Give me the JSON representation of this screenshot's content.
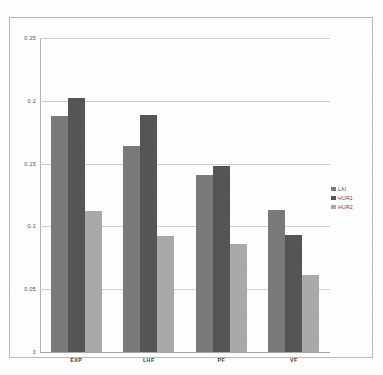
{
  "chart_data": {
    "type": "bar",
    "title": "",
    "xlabel": "",
    "ylabel": "",
    "categories": [
      "EXP",
      "LHF",
      "PF",
      "VF"
    ],
    "series": [
      {
        "name": "LAI",
        "color": "#7a7a7a",
        "values": [
          0.188,
          0.164,
          0.141,
          0.113
        ]
      },
      {
        "name": "HUR1",
        "color": "#555555",
        "values": [
          0.202,
          0.189,
          0.148,
          0.093
        ]
      },
      {
        "name": "HUR2",
        "color": "#a9a9a9",
        "values": [
          0.112,
          0.092,
          0.086,
          0.061
        ]
      }
    ],
    "ylim": [
      0,
      0.25
    ],
    "ytick_values": [
      0,
      0.05,
      0.1,
      0.15,
      0.2,
      0.25
    ],
    "ytick_labels": [
      "0",
      "0.05",
      "0.1",
      "0.15",
      "0.2",
      "0.25"
    ],
    "grid": true,
    "legend_position": "center-right"
  },
  "legend": {
    "entries": [
      {
        "label": "LAI"
      },
      {
        "label": "HUR1"
      },
      {
        "label": "HUR2"
      }
    ]
  },
  "axes": {
    "y_labels": [
      "0.25",
      "0.2",
      "0.15",
      "0.1",
      "0.05",
      "0"
    ],
    "x_labels": [
      "EXP",
      "LHF",
      "PF",
      "VF"
    ]
  }
}
